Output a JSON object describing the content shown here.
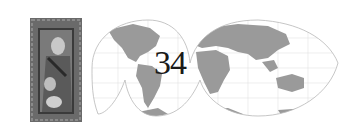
{
  "graphic": {
    "page_number": "34",
    "colors": {
      "land": "#9a9a9a",
      "outline": "#b8b8b8",
      "grid": "#e2e2e2",
      "frame": "#5a5a5a",
      "frame_inner": "#2a2a2a",
      "text": "#1a1a1a"
    }
  }
}
